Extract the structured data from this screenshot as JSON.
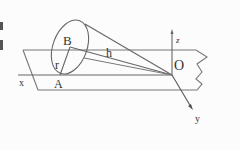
{
  "diagram": {
    "title": "",
    "labels": {
      "B": "B",
      "h": "h",
      "r": "r",
      "A": "A",
      "O": "O",
      "x": "x",
      "y": "y",
      "z": "z"
    },
    "margin_text": [
      "i",
      "e"
    ],
    "colors": {
      "line": "#555555",
      "text": "#333333",
      "background": "#fcfcfc"
    }
  }
}
